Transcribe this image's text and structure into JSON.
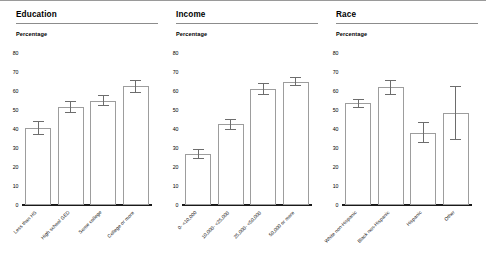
{
  "chart_data": {
    "type": "bar",
    "title": "",
    "ylabel": "Percentage",
    "xlabel": "",
    "ylim": [
      0,
      80
    ],
    "yticks": [
      0,
      10,
      20,
      30,
      40,
      50,
      60,
      70,
      80
    ],
    "grid": false,
    "legend": "none",
    "orientation": "vertical",
    "bar_style": {
      "fill": "#ffffff",
      "edge": "#9d9d9d",
      "errorbar_color": "#6d6d6d"
    },
    "panels": [
      {
        "title": "Education",
        "ylabel": "Percentage",
        "categories": [
          "Less than HS",
          "High school GED",
          "Some college",
          "College or more"
        ],
        "values": [
          40.5,
          51.5,
          55.0,
          62.5
        ],
        "errors": [
          3.5,
          3.0,
          3.0,
          3.5
        ]
      },
      {
        "title": "Income",
        "ylabel": "Percentage",
        "categories": [
          "0- <10,000",
          "10,000- <25,000",
          "25,000- <50,000",
          "50,000 or more"
        ],
        "values": [
          27.0,
          42.5,
          61.0,
          65.0
        ],
        "errors": [
          2.5,
          3.0,
          3.0,
          2.5
        ]
      },
      {
        "title": "Race",
        "ylabel": "Percentage",
        "categories": [
          "White non-Hispanic",
          "Black non-Hispanic",
          "Hispanic",
          "Other"
        ],
        "values": [
          53.5,
          62.0,
          38.0,
          48.5
        ],
        "errors": [
          2.5,
          4.0,
          5.5,
          14.0
        ]
      }
    ]
  }
}
